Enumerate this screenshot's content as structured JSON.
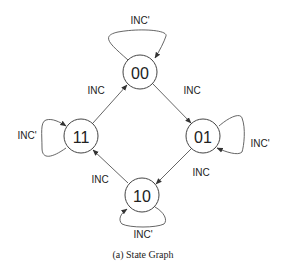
{
  "figure": {
    "caption": "(a)  State Graph"
  },
  "states": [
    {
      "id": "s00",
      "label": "00"
    },
    {
      "id": "s01",
      "label": "01"
    },
    {
      "id": "s10",
      "label": "10"
    },
    {
      "id": "s11",
      "label": "11"
    }
  ],
  "transitions": [
    {
      "from": "00",
      "to": "01",
      "label": "INC"
    },
    {
      "from": "01",
      "to": "10",
      "label": "INC"
    },
    {
      "from": "10",
      "to": "11",
      "label": "INC"
    },
    {
      "from": "11",
      "to": "00",
      "label": "INC"
    },
    {
      "from": "00",
      "to": "00",
      "label": "INC'"
    },
    {
      "from": "01",
      "to": "01",
      "label": "INC'"
    },
    {
      "from": "10",
      "to": "10",
      "label": "INC'"
    },
    {
      "from": "11",
      "to": "11",
      "label": "INC'"
    }
  ],
  "colors": {
    "stroke": "#444444",
    "text": "#222222",
    "background": "#ffffff"
  }
}
